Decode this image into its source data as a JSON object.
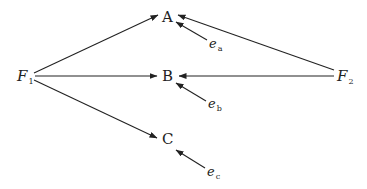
{
  "diagram": {
    "type": "path-diagram",
    "colors": {
      "stroke": "#222222",
      "text": "#222222",
      "background": "#ffffff"
    },
    "factors": [
      {
        "id": "F1",
        "base": "F",
        "sub": "1"
      },
      {
        "id": "F2",
        "base": "F",
        "sub": "2"
      }
    ],
    "indicators": [
      {
        "id": "A",
        "label": "A"
      },
      {
        "id": "B",
        "label": "B"
      },
      {
        "id": "C",
        "label": "C"
      }
    ],
    "errors": [
      {
        "id": "ea",
        "base": "e",
        "sub": "a"
      },
      {
        "id": "eb",
        "base": "e",
        "sub": "b"
      },
      {
        "id": "ec",
        "base": "e",
        "sub": "c"
      }
    ],
    "edges": [
      {
        "from": "F1",
        "to": "A"
      },
      {
        "from": "F1",
        "to": "B"
      },
      {
        "from": "F1",
        "to": "C"
      },
      {
        "from": "F2",
        "to": "A"
      },
      {
        "from": "F2",
        "to": "B"
      },
      {
        "from": "ea",
        "to": "A"
      },
      {
        "from": "eb",
        "to": "B"
      },
      {
        "from": "ec",
        "to": "C"
      }
    ]
  }
}
